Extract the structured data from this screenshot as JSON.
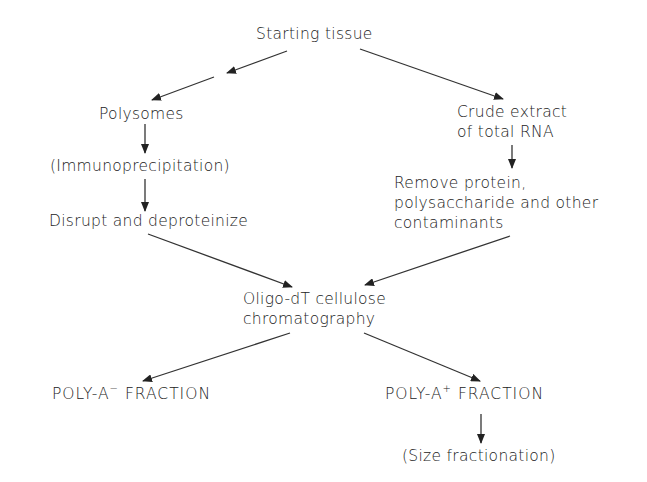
{
  "diagram": {
    "type": "flowchart",
    "nodes": {
      "start": {
        "label": "Starting tissue"
      },
      "polysomes": {
        "label": "Polysomes"
      },
      "immuno": {
        "label": "(Immunoprecipitation)"
      },
      "disrupt": {
        "label": "Disrupt and deproteinize"
      },
      "crude_l1": {
        "label": "Crude extract"
      },
      "crude_l2": {
        "label": "of total RNA"
      },
      "remove_l1": {
        "label": "Remove protein,"
      },
      "remove_l2": {
        "label": "polysaccharide and other"
      },
      "remove_l3": {
        "label": "contaminants"
      },
      "oligo_l1": {
        "label": "Oligo-dT cellulose"
      },
      "oligo_l2": {
        "label": "chromatography"
      },
      "polyA_minus": {
        "prefix": "POLY-A",
        "sup": "−",
        "suffix": " FRACTION"
      },
      "polyA_plus": {
        "prefix": "POLY-A",
        "sup": "+",
        "suffix": " FRACTION"
      },
      "size": {
        "label": "(Size fractionation)"
      }
    },
    "edges": [
      {
        "from": "Starting tissue",
        "to": "Polysomes",
        "note": "broken arrow (two segments)"
      },
      {
        "from": "Starting tissue",
        "to": "Crude extract of total RNA"
      },
      {
        "from": "Polysomes",
        "to": "(Immunoprecipitation)"
      },
      {
        "from": "(Immunoprecipitation)",
        "to": "Disrupt and deproteinize"
      },
      {
        "from": "Crude extract of total RNA",
        "to": "Remove protein, polysaccharide and other contaminants"
      },
      {
        "from": "Disrupt and deproteinize",
        "to": "Oligo-dT cellulose chromatography"
      },
      {
        "from": "Remove protein, polysaccharide and other contaminants",
        "to": "Oligo-dT cellulose chromatography"
      },
      {
        "from": "Oligo-dT cellulose chromatography",
        "to": "POLY-A- FRACTION"
      },
      {
        "from": "Oligo-dT cellulose chromatography",
        "to": "POLY-A+ FRACTION"
      },
      {
        "from": "POLY-A+ FRACTION",
        "to": "(Size fractionation)"
      }
    ]
  }
}
